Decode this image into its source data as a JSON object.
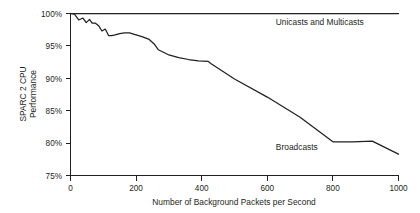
{
  "chart_data": {
    "type": "line",
    "title": "",
    "subtitle": "",
    "xlabel": "Number of Background Packets per Second",
    "ylabel": "SPARC 2 CPU Performance",
    "ylabel_line1": "SPARC 2 CPU",
    "ylabel_line2": "Performance",
    "xlim": [
      0,
      1000
    ],
    "ylim": [
      75,
      100
    ],
    "xticks": [
      0,
      200,
      400,
      600,
      800,
      1000
    ],
    "xtick_labels": [
      "0",
      "200",
      "400",
      "600",
      "800",
      "1000"
    ],
    "yticks": [
      75,
      80,
      85,
      90,
      95,
      100
    ],
    "ytick_labels": [
      "75%",
      "80%",
      "85%",
      "90%",
      "95%",
      "100%"
    ],
    "grid": false,
    "legend_position": "inline-annotation",
    "line_color": "#231f20",
    "background_color": "#ffffff",
    "series": [
      {
        "name": "Unicasts and Multicasts",
        "label_x": 760,
        "label_y": 98.3,
        "x": [
          0,
          1000
        ],
        "values": [
          100,
          100
        ]
      },
      {
        "name": "Broadcasts",
        "label_x": 690,
        "label_y": 79.0,
        "x": [
          0,
          12,
          25,
          38,
          48,
          58,
          66,
          76,
          86,
          96,
          106,
          116,
          126,
          136,
          150,
          165,
          180,
          200,
          220,
          240,
          255,
          268,
          280,
          300,
          330,
          360,
          390,
          420,
          430,
          500,
          600,
          700,
          800,
          860,
          920,
          1000
        ],
        "values": [
          100.0,
          99.9,
          99.0,
          99.3,
          98.6,
          99.1,
          98.5,
          98.5,
          98.1,
          97.3,
          97.6,
          96.6,
          96.6,
          96.7,
          96.9,
          97.0,
          97.0,
          96.7,
          96.4,
          96.0,
          95.3,
          94.4,
          94.1,
          93.6,
          93.2,
          92.9,
          92.7,
          92.6,
          92.2,
          89.9,
          87.1,
          84.0,
          80.2,
          80.2,
          80.3,
          78.3
        ]
      }
    ]
  },
  "axes": {
    "x_axis_name": "x-axis",
    "y_axis_name": "y-axis"
  }
}
